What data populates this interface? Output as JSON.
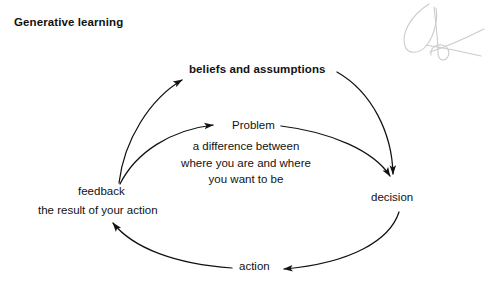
{
  "page": {
    "title": "Generative learning",
    "background_color": "#ffffff",
    "ink_color": "#121212"
  },
  "diagram": {
    "type": "cycle-diagram",
    "nodes": [
      {
        "id": "beliefs",
        "label": "beliefs and assumptions",
        "emphasis": "bold"
      },
      {
        "id": "problem",
        "label": "Problem",
        "emphasis": "normal"
      },
      {
        "id": "decision",
        "label": "decision",
        "emphasis": "normal"
      },
      {
        "id": "action",
        "label": "action",
        "emphasis": "normal"
      },
      {
        "id": "feedback",
        "label": "feedback",
        "emphasis": "normal"
      }
    ],
    "problem_description": {
      "lines": [
        "a difference between",
        "where you are and where",
        "you want to be"
      ]
    },
    "feedback_description": {
      "text": "the result of your action"
    },
    "edges": [
      {
        "from": "feedback",
        "to": "beliefs",
        "loop": "outer"
      },
      {
        "from": "beliefs",
        "to": "decision",
        "loop": "outer"
      },
      {
        "from": "decision",
        "to": "action",
        "loop": "outer"
      },
      {
        "from": "action",
        "to": "feedback",
        "loop": "outer"
      },
      {
        "from": "feedback",
        "to": "problem",
        "loop": "inner"
      },
      {
        "from": "problem",
        "to": "decision",
        "loop": "inner"
      }
    ]
  },
  "annotation": {
    "margin_mark": "handwritten-scribble"
  }
}
